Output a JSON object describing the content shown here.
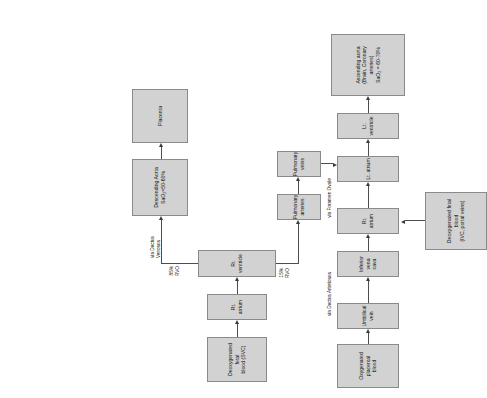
{
  "diagram": {
    "orientation": "rotated-90-ccw",
    "box_fill": "#d2d2d2",
    "box_stroke": "#8a8a8a",
    "connector_color": "#4d4d4d",
    "background": "#ffffff",
    "nodes": {
      "deox_svc": "Deoxygenated fetal\nblood (SVC)",
      "rt_atrium_top": "Rt. atrium",
      "rt_ventricle": "Rt. ventricle",
      "descending_aorta": "Descending Aorta\nSaO₂=50-60%",
      "placenta": "Placenta",
      "pulmonary_arteries": "Pulmonary arteries",
      "pulmonary_veins": "Pulmonary veins",
      "oxy_placental": "Oxygenated placental\nblood",
      "umbilical_vein": "Umbilical vein",
      "inferior_vena_cava": "Inferior vena cava",
      "rt_atrium_bottom": "Rt. atrium",
      "lt_atrium": "Lt. atrium",
      "lt_ventricle": "Lt. ventricle",
      "ascending_aorta": "Ascending aorta\n(Brain, Coronary\narteries)\nSaO₂ = 60-70%",
      "deox_ivc_portal": "Deoxygenated fetal\nblood\n(IVC, portal veins)"
    },
    "edge_labels": {
      "via_ductus_venosus": "via Ductus Venosus",
      "rvo_85": "85%\nRVO",
      "rvo_15": "15%\nRVO",
      "via_ductus_arteriosus": "via Ductus Arteriosus",
      "via_foramen_ovale": "via Foramen Ovale"
    }
  }
}
